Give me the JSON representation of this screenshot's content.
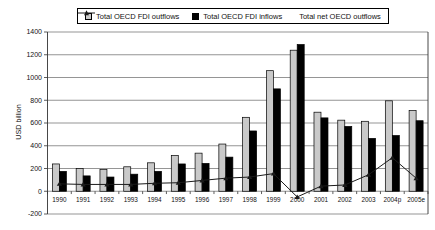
{
  "chart_data": {
    "type": "bar",
    "title": "",
    "ylabel": "USD billion",
    "ylim": [
      -200,
      1400
    ],
    "yticks": [
      -200,
      0,
      200,
      400,
      600,
      800,
      1000,
      1200,
      1400
    ],
    "grid": true,
    "legend_position": "top",
    "categories": [
      "1990",
      "1991",
      "1992",
      "1993",
      "1994",
      "1995",
      "1996",
      "1997",
      "1998",
      "1999",
      "2000",
      "2001",
      "2002",
      "2003",
      "2004p",
      "2005e"
    ],
    "series": [
      {
        "name": "Total OECD FDI outflows",
        "type": "bar",
        "color": "#c9c9c9",
        "values": [
          240,
          200,
          190,
          215,
          250,
          315,
          335,
          415,
          650,
          1060,
          1240,
          695,
          625,
          615,
          795,
          710
        ]
      },
      {
        "name": "Total OECD FDI inflows",
        "type": "bar",
        "color": "#000000",
        "values": [
          175,
          135,
          125,
          150,
          175,
          240,
          245,
          300,
          530,
          900,
          1290,
          645,
          570,
          465,
          490,
          620
        ]
      },
      {
        "name": "Total net OECD outflows",
        "type": "line",
        "color": "#1a1a1a",
        "values": [
          65,
          60,
          60,
          60,
          70,
          75,
          95,
          115,
          125,
          155,
          -50,
          45,
          55,
          145,
          295,
          115
        ]
      }
    ]
  }
}
